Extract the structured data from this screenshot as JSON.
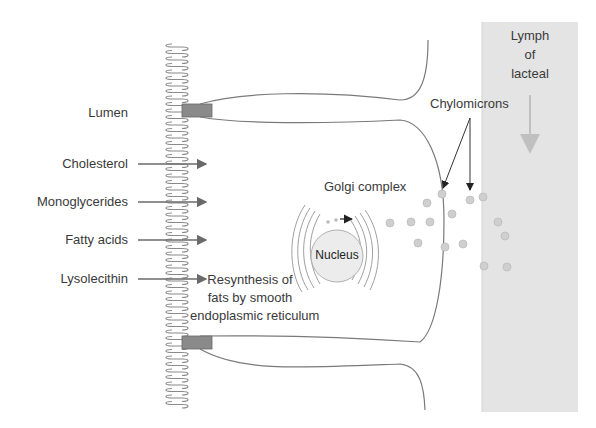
{
  "diagram": {
    "left_labels": {
      "lumen": "Lumen",
      "cholesterol": "Cholesterol",
      "monoglycerides": "Monoglycerides",
      "fatty_acids": "Fatty acids",
      "lysolecithin": "Lysolecithin"
    },
    "golgi": "Golgi complex",
    "nucleus": "Nucleus",
    "resynthesis": [
      "Resynthesis of",
      "fats by smooth",
      "endoplasmic reticulum"
    ],
    "chylomicrons": "Chylomicrons",
    "lymph": [
      "Lymph",
      "of",
      "lacteal"
    ],
    "colors": {
      "line": "#7a7a7a",
      "text": "#3a3a3a",
      "lacteal": "#e2e2e2",
      "junction": "#8a8a8a",
      "chylomicron": "#c8c8c8"
    }
  }
}
